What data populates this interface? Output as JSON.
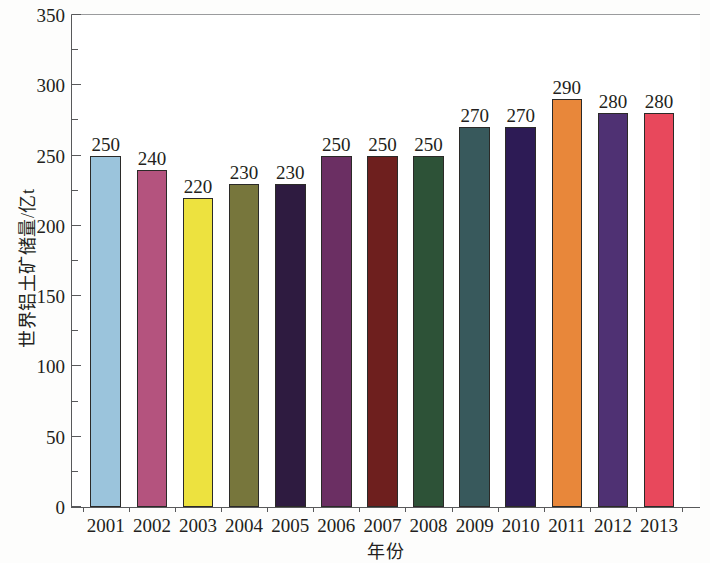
{
  "chart_data": {
    "type": "bar",
    "title": "",
    "xlabel": "年份",
    "ylabel": "世界铝土矿储量/亿t",
    "categories": [
      "2001",
      "2002",
      "2003",
      "2004",
      "2005",
      "2006",
      "2007",
      "2008",
      "2009",
      "2010",
      "2011",
      "2012",
      "2013"
    ],
    "values": [
      250,
      240,
      220,
      230,
      230,
      250,
      250,
      250,
      270,
      270,
      290,
      280,
      280
    ],
    "value_labels": [
      "250",
      "240",
      "220",
      "230",
      "230",
      "250",
      "250",
      "250",
      "270",
      "270",
      "290",
      "280",
      "280"
    ],
    "bar_colors": [
      "#9BC4DC",
      "#B4537E",
      "#EDE23F",
      "#77763C",
      "#2E1B40",
      "#6B2F63",
      "#6E1F1E",
      "#2D5237",
      "#38595C",
      "#2D1B55",
      "#E8873A",
      "#4F3173",
      "#E8485C"
    ],
    "ylim": [
      0,
      350
    ],
    "ytick_values": [
      0,
      50,
      100,
      150,
      200,
      250,
      300,
      350
    ],
    "ytick_labels": [
      "0",
      "50",
      "100",
      "150",
      "200",
      "250",
      "300",
      "350"
    ],
    "yminor_values": [
      25,
      75,
      125,
      175,
      225,
      275,
      325
    ],
    "grid": false,
    "legend": "none",
    "axis_color": "#58595b",
    "bar_edge_color": "#2b2a28",
    "background_color": "#ffffff"
  }
}
